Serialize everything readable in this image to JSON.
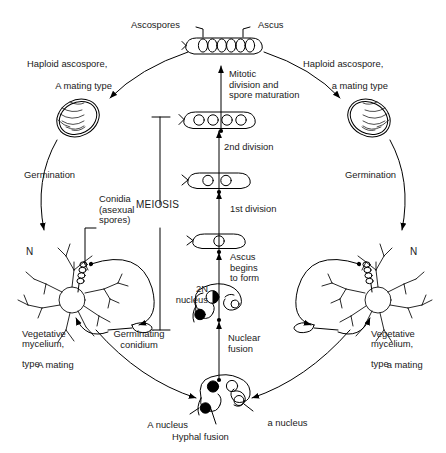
{
  "figure": {
    "kind": "life-cycle-diagram",
    "stroke_color": "#000000",
    "background_color": "#ffffff",
    "text_color": "#1a1a1a"
  },
  "labels": {
    "ascospores": "Ascospores",
    "ascus": "Ascus",
    "mitotic_division": "Mitotic\ndivision and\nspore maturation",
    "haploid_ascospore_A": "Haploid ascospore,",
    "haploid_ascospore_A_italic": "A",
    "haploid_ascospore_A_rest": " mating type",
    "haploid_ascospore_a": "Haploid ascospore,",
    "haploid_ascospore_a_italic": "a",
    "haploid_ascospore_a_rest": " mating type",
    "germination_left": "Germination",
    "germination_right": "Germination",
    "second_division": "2nd division",
    "first_division": "1st division",
    "meiosis": "MEIOSIS",
    "conidia": "Conidia\n(asexual\nspores)",
    "n_left": "N",
    "n_right": "N",
    "vegetative_mycelium_A_l1": "Vegetative",
    "vegetative_mycelium_A_l2": "mycelium,",
    "vegetative_mycelium_A_italic": "A",
    "vegetative_mycelium_A_l3_rest": " mating",
    "vegetative_mycelium_A_l4": "type",
    "vegetative_mycelium_a_l1": "Vegetative",
    "vegetative_mycelium_a_l2": "mycelium,",
    "vegetative_mycelium_a_italic": "a",
    "vegetative_mycelium_a_l3_rest": " mating",
    "vegetative_mycelium_a_l4": "type",
    "germinating_conidium": "Germinating\nconidium",
    "two_n_nucleus": "2N\nnucleus",
    "ascus_begins_to_form": "Ascus\nbegins\nto form",
    "nuclear_fusion": "Nuclear\nfusion",
    "a_nucleus_upper_italic": "A",
    "a_nucleus_upper_rest": " nucleus",
    "a_nucleus_lower_italic": "a",
    "a_nucleus_lower_rest": " nucleus",
    "hyphal_fusion": "Hyphal fusion"
  },
  "stages": {
    "mature_ascus_spore_count": 8,
    "post_second_division_count": 4,
    "post_first_division_count": 2,
    "zygote_nucleus_count": 1,
    "crozier_nuclei": [
      "half-filled",
      "open",
      "filled"
    ],
    "fusion_cell_nuclei": [
      "filled",
      "open",
      "open",
      "filled"
    ]
  }
}
